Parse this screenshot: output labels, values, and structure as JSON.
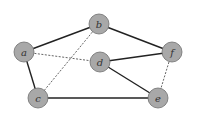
{
  "diagram": {
    "type": "undirected-graph",
    "colors": {
      "node_fill": "#a8a8a8",
      "node_stroke": "#6e6e6e",
      "edge_solid": "#222222",
      "edge_dashed": "#555555",
      "label": "#333333"
    },
    "nodes": [
      {
        "id": "a",
        "label": "a",
        "x": 24,
        "y": 52
      },
      {
        "id": "b",
        "label": "b",
        "x": 99,
        "y": 24
      },
      {
        "id": "c",
        "label": "c",
        "x": 38,
        "y": 98
      },
      {
        "id": "d",
        "label": "d",
        "x": 100,
        "y": 62
      },
      {
        "id": "e",
        "label": "e",
        "x": 158,
        "y": 98
      },
      {
        "id": "f",
        "label": "f",
        "x": 172,
        "y": 52
      }
    ],
    "edges": [
      {
        "from": "a",
        "to": "b",
        "style": "solid"
      },
      {
        "from": "b",
        "to": "f",
        "style": "solid"
      },
      {
        "from": "a",
        "to": "c",
        "style": "solid"
      },
      {
        "from": "c",
        "to": "e",
        "style": "solid"
      },
      {
        "from": "d",
        "to": "f",
        "style": "solid"
      },
      {
        "from": "d",
        "to": "e",
        "style": "solid"
      },
      {
        "from": "a",
        "to": "d",
        "style": "dashed"
      },
      {
        "from": "b",
        "to": "c",
        "style": "dashed"
      },
      {
        "from": "f",
        "to": "e",
        "style": "dashed"
      }
    ]
  }
}
